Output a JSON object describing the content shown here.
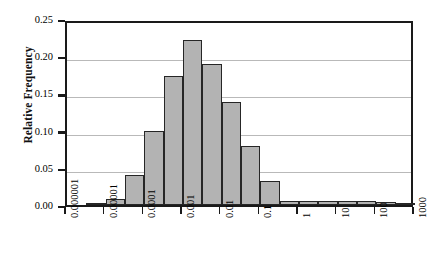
{
  "chart_data": {
    "type": "bar",
    "title": "",
    "xlabel": "",
    "ylabel": "Relative Frequency",
    "ylim": [
      0.0,
      0.25
    ],
    "yticks": [
      0.0,
      0.05,
      0.1,
      0.15,
      0.2,
      0.25
    ],
    "ytick_labels": [
      "0.00",
      "0.05",
      "0.10",
      "0.15",
      "0.20",
      "0.25"
    ],
    "xscale": "log",
    "xlim": [
      1e-06,
      1000
    ],
    "xticks": [
      1e-06,
      1e-05,
      0.0001,
      0.001,
      0.01,
      0.1,
      1,
      10,
      100,
      1000
    ],
    "xtick_labels": [
      "0.000001",
      "0.00001",
      "0.0001",
      "0.001",
      "0.01",
      "0.1",
      "1",
      "10",
      "100",
      "1000"
    ],
    "grid": true,
    "grid_axis": "y",
    "legend": false,
    "bin_edges_decades": [
      -6.0,
      -5.5,
      -5.0,
      -4.5,
      -4.0,
      -3.5,
      -3.0,
      -2.5,
      -2.0,
      -1.5,
      -1.0,
      -0.5,
      0.0,
      0.5,
      1.0,
      1.5,
      2.0,
      2.5,
      3.0
    ],
    "categories": [
      "1e-6 to 3.16e-6",
      "3.16e-6 to 1e-5",
      "1e-5 to 3.16e-5",
      "3.16e-5 to 1e-4",
      "1e-4 to 3.16e-4",
      "3.16e-4 to 1e-3",
      "1e-3 to 3.16e-3",
      "3.16e-3 to 1e-2",
      "1e-2 to 3.16e-2",
      "3.16e-2 to 1e-1",
      "1e-1 to 3.16e-1",
      "3.16e-1 to 1",
      "1 to 3.16",
      "3.16 to 10",
      "10 to 31.6",
      "31.6 to 100",
      "100 to 316",
      "316 to 1000"
    ],
    "values": [
      0.0,
      0.003,
      0.008,
      0.04,
      0.1,
      0.174,
      0.222,
      0.19,
      0.138,
      0.079,
      0.032,
      0.006,
      0.005,
      0.006,
      0.006,
      0.006,
      0.004,
      0.002
    ],
    "bar_fill_color": "#b3b3b3",
    "bar_edge_color": "#262626",
    "axis_color": "#1a1a1a",
    "grid_color": "#b9b9b9",
    "background_color": "#ffffff"
  },
  "axes": {
    "y_title": "Relative Frequency"
  }
}
